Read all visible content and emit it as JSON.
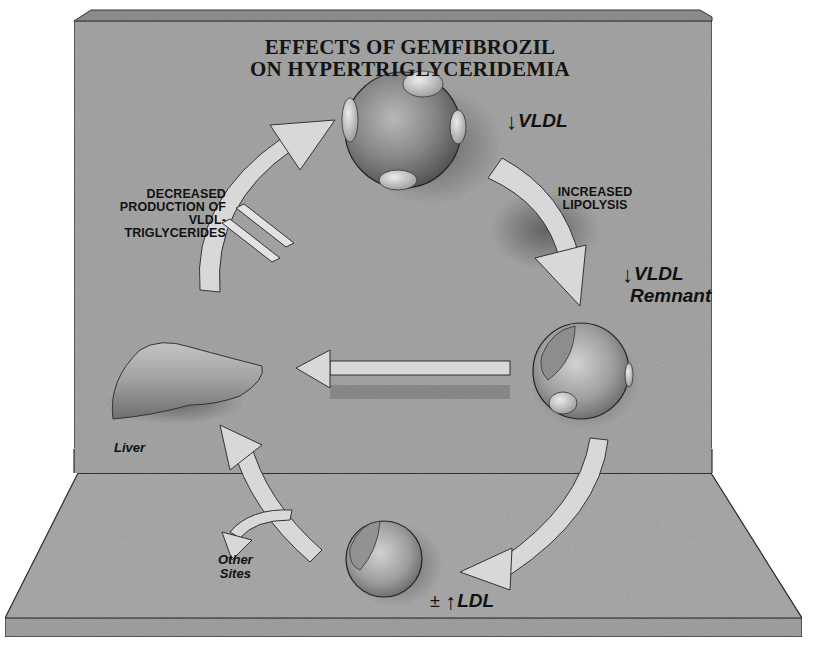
{
  "title": {
    "line1": "EFFECTS OF GEMFIBROZIL",
    "line2": "ON HYPERTRIGLYCERIDEMIA"
  },
  "labels": {
    "vldl_top": {
      "arrow": "↓",
      "text": "VLDL"
    },
    "decreased_production": [
      "DECREASED",
      "PRODUCTION OF",
      "VLDL-TRIGLYCERIDES"
    ],
    "increased_lipolysis": [
      "INCREASED",
      "LIPOLYSIS"
    ],
    "vldl_remnant": {
      "arrow": "↓",
      "line1": "VLDL",
      "line2": "Remnant"
    },
    "liver": "Liver",
    "other_sites": [
      "Other",
      "Sites"
    ],
    "ldl": {
      "prefix": "±",
      "arrow": "↑",
      "text": "LDL"
    }
  },
  "nodes": [
    {
      "id": "vldl-particle",
      "label": "VLDL"
    },
    {
      "id": "vldl-remnant-particle",
      "label": "VLDL Remnant"
    },
    {
      "id": "ldl-particle",
      "label": "LDL"
    },
    {
      "id": "liver",
      "label": "Liver"
    }
  ],
  "edges": [
    {
      "from": "liver",
      "to": "vldl-particle",
      "label": "DECREASED PRODUCTION OF VLDL-TRIGLYCERIDES",
      "blocked": true
    },
    {
      "from": "vldl-particle",
      "to": "vldl-remnant-particle",
      "label": "INCREASED LIPOLYSIS"
    },
    {
      "from": "vldl-remnant-particle",
      "to": "liver",
      "label": ""
    },
    {
      "from": "vldl-remnant-particle",
      "to": "ldl-particle",
      "label": ""
    },
    {
      "from": "ldl-particle",
      "to": "liver",
      "label": ""
    },
    {
      "from": "ldl-particle",
      "to": "other-sites",
      "label": "Other Sites"
    }
  ],
  "colors": {
    "board": "#a6a6a6",
    "board_dark": "#8f8f8f",
    "floor": "#a9a9a9",
    "outline": "#2a2a2a",
    "arrow_fill": "#d9d9d9",
    "particle": "#8c8c8c",
    "particle_cap": "#c8c8c8"
  }
}
